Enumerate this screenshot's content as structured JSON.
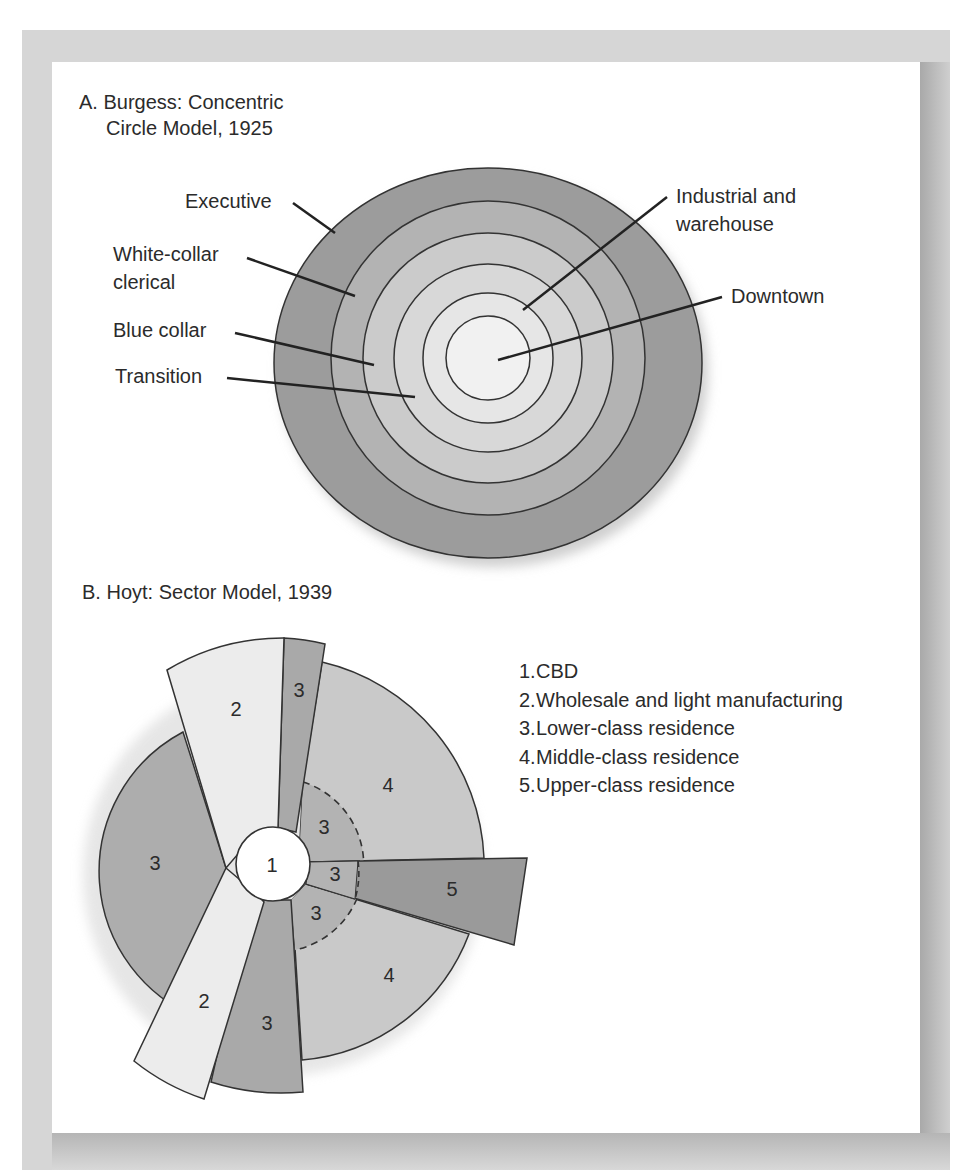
{
  "panel_a": {
    "title_line1": "A. Burgess: Concentric",
    "title_line2": "Circle Model, 1925",
    "labels": {
      "executive": "Executive",
      "white_collar_line1": "White-collar",
      "white_collar_line2": "clerical",
      "blue_collar": "Blue collar",
      "transition": "Transition",
      "industrial_line1": "Industrial and",
      "industrial_line2": "warehouse",
      "downtown": "Downtown"
    },
    "rings_outer_to_inner": [
      "Executive",
      "White-collar clerical",
      "Blue collar",
      "Transition",
      "Industrial and warehouse",
      "Downtown"
    ]
  },
  "panel_b": {
    "title": "B. Hoyt: Sector Model, 1939",
    "sector_labels": {
      "cbd": "1",
      "wholesale_top": "2",
      "wholesale_bottom": "2",
      "lower_top": "3",
      "lower_left": "3",
      "lower_inner_upper": "3",
      "lower_inner_mid": "3",
      "lower_inner_lower": "3",
      "lower_bottom": "3",
      "middle_upper": "4",
      "middle_lower": "4",
      "upper": "5"
    },
    "legend": [
      {
        "num": "1.",
        "label": "CBD"
      },
      {
        "num": "2.",
        "label": "Wholesale and light manufacturing"
      },
      {
        "num": "3.",
        "label": "Lower-class residence"
      },
      {
        "num": "4.",
        "label": "Middle-class residence"
      },
      {
        "num": "5.",
        "label": "Upper-class residence"
      }
    ]
  },
  "colors": {
    "frame": "#d6d6d6",
    "dark": "#9b9b9b",
    "medium": "#adadad",
    "light": "#c9c9c9",
    "lighter": "#dcdcdc",
    "lightest": "#ededed",
    "stroke": "#333333"
  }
}
